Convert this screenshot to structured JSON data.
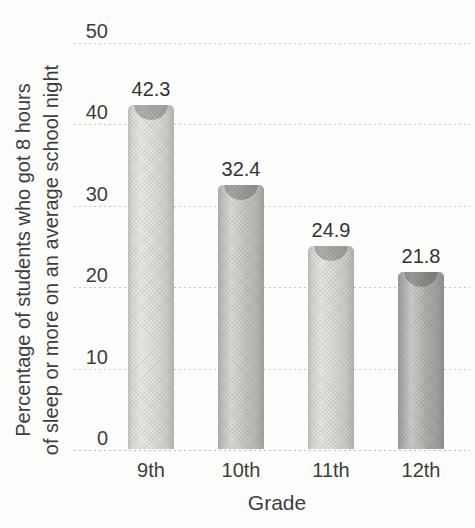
{
  "chart_data": {
    "type": "bar",
    "categories": [
      "9th",
      "10th",
      "11th",
      "12th"
    ],
    "values": [
      42.3,
      32.4,
      24.9,
      21.8
    ],
    "title": "",
    "xlabel": "Grade",
    "ylabel": "Percentage of students who got 8 hours of sleep or more on an average school night",
    "ylabel_lines": [
      "Percentage of students who got 8 hours",
      "of sleep or more on an average school night"
    ],
    "ylim": [
      0,
      50
    ],
    "yticks": [
      50,
      40,
      30,
      20,
      10,
      0
    ],
    "grid": "horizontal-dotted",
    "legend": "none",
    "bar_colors": [
      "#dbdbd7",
      "#c3c3bf",
      "#d6d6d2",
      "#adadaa"
    ],
    "gridline_color": "#c8c8c6",
    "text_color": "#3c3c3c",
    "background_color": "#fdfdfc"
  }
}
